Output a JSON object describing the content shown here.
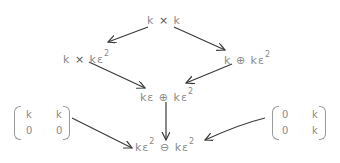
{
  "diagram": {
    "nodes": {
      "top": {
        "a": "k",
        "op": "×",
        "b": "k"
      },
      "left": {
        "a": "k",
        "op": "×",
        "b": "kε",
        "exp": "2"
      },
      "right": {
        "a": "k",
        "op": "⊕",
        "b": "kε",
        "exp": "2"
      },
      "middle": {
        "a": "kε",
        "op": "⊕",
        "b": "kε",
        "exp": "2"
      },
      "bottom": {
        "a": "kε",
        "exp_a": "2",
        "op": "⊖",
        "b": "kε",
        "exp_b": "2"
      }
    },
    "matrices": {
      "left": {
        "r1c1": "k",
        "r1c2": "k",
        "r2c1": "0",
        "r2c2": "0"
      },
      "right": {
        "r1c1": "0",
        "r1c2": "k",
        "r2c1": "0",
        "r2c2": "k"
      }
    },
    "arrows": [
      {
        "from": "top",
        "to": "left"
      },
      {
        "from": "top",
        "to": "right"
      },
      {
        "from": "left",
        "to": "middle"
      },
      {
        "from": "right",
        "to": "middle"
      },
      {
        "from": "middle",
        "to": "bottom"
      },
      {
        "from": "matrix-left",
        "to": "bottom"
      },
      {
        "from": "matrix-right",
        "to": "bottom"
      }
    ],
    "colors": {
      "text": "#8a8a8a",
      "arrow": "#3a3a3a"
    }
  }
}
